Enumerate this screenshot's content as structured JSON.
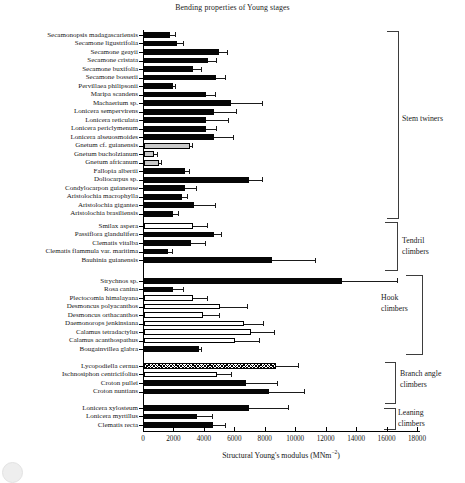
{
  "title": "Bending properties of Young stages",
  "x_axis": {
    "label_main": "Structural Young's modulus (MNm",
    "label_sup": "−2",
    "label_close": ")",
    "ticks": [
      0,
      2000,
      4000,
      6000,
      8000,
      10000,
      12000,
      14000,
      16000,
      18000
    ],
    "min": 0,
    "max": 18000
  },
  "legend_styles": {
    "black": "#060606",
    "gray": "#c9c9c9",
    "white": "#ffffff",
    "hatch": "crosshatch-pattern"
  },
  "chart_data": {
    "type": "bar",
    "orientation": "horizontal",
    "title": "Bending properties of Young stages",
    "xlabel": "Structural Young's modulus (MNm-2)",
    "xlim": [
      0,
      18000
    ],
    "grid": false,
    "error_bars": "upper-only",
    "groups": [
      {
        "label": "Stem twiners",
        "bars": [
          {
            "name": "Secamonopsis madagascariensis",
            "value": 1700,
            "error_high": 2100,
            "style": "black"
          },
          {
            "name": "Secamone ligustrifolia",
            "value": 2200,
            "error_high": 2600,
            "style": "black"
          },
          {
            "name": "Secamone geayii",
            "value": 4900,
            "error_high": 5500,
            "style": "black"
          },
          {
            "name": "Secamone cristata",
            "value": 4200,
            "error_high": 4800,
            "style": "black"
          },
          {
            "name": "Secamone buxifolia",
            "value": 3200,
            "error_high": 3800,
            "style": "black"
          },
          {
            "name": "Secamone bosserii",
            "value": 4700,
            "error_high": 5400,
            "style": "black"
          },
          {
            "name": "Pervillaea philipsonii",
            "value": 1900,
            "error_high": 2100,
            "style": "black"
          },
          {
            "name": "Maripa scandens",
            "value": 4100,
            "error_high": 4700,
            "style": "black"
          },
          {
            "name": "Machaerium sp.",
            "value": 5700,
            "error_high": 7800,
            "style": "black"
          },
          {
            "name": "Lonicera sempervirens",
            "value": 4600,
            "error_high": 6100,
            "style": "black"
          },
          {
            "name": "Lonicera reticulata",
            "value": 4100,
            "error_high": 5600,
            "style": "black"
          },
          {
            "name": "Lonicera periclymenum",
            "value": 4100,
            "error_high": 4800,
            "style": "black"
          },
          {
            "name": "Lonicera alseuosmoides",
            "value": 4600,
            "error_high": 5900,
            "style": "black"
          },
          {
            "name": "Gnetum cf. guianensis",
            "value": 3000,
            "error_high": 3200,
            "style": "gray"
          },
          {
            "name": "Gnetum bucholzianum",
            "value": 650,
            "error_high": 900,
            "style": "gray"
          },
          {
            "name": "Gnetum africanum",
            "value": 1000,
            "error_high": 1200,
            "style": "gray"
          },
          {
            "name": "Fallopia albertii",
            "value": 2700,
            "error_high": 3000,
            "style": "black"
          },
          {
            "name": "Doliocarpus sp.",
            "value": 6900,
            "error_high": 7800,
            "style": "black"
          },
          {
            "name": "Condylocarpon guianense",
            "value": 2700,
            "error_high": 3500,
            "style": "black"
          },
          {
            "name": "Aristolochia macrophylla",
            "value": 2500,
            "error_high": 2900,
            "style": "black"
          },
          {
            "name": "Aristolochia gigantea",
            "value": 3300,
            "error_high": 4700,
            "style": "black"
          },
          {
            "name": "Aristolochia brasiliensis",
            "value": 1900,
            "error_high": 2300,
            "style": "black"
          }
        ]
      },
      {
        "label": "Tendril climbers",
        "bars": [
          {
            "name": "Smilax aspera",
            "value": 3200,
            "error_high": 4200,
            "style": "white"
          },
          {
            "name": "Passiflora glandulifera",
            "value": 4600,
            "error_high": 5100,
            "style": "black"
          },
          {
            "name": "Clematis vitalba",
            "value": 3100,
            "error_high": 4100,
            "style": "black"
          },
          {
            "name": "Clematis flammula var. maritima",
            "value": 1600,
            "error_high": 1900,
            "style": "black"
          },
          {
            "name": "Bauhinia guianensis",
            "value": 8400,
            "error_high": 11300,
            "style": "black"
          }
        ]
      },
      {
        "label": "Hook climbers",
        "bars": [
          {
            "name": "Strychnos sp.",
            "value": 13000,
            "error_high": 16700,
            "style": "black"
          },
          {
            "name": "Rosa canina",
            "value": 1900,
            "error_high": 2600,
            "style": "black"
          },
          {
            "name": "Plectocomia himalayana",
            "value": 3200,
            "error_high": 4200,
            "style": "white"
          },
          {
            "name": "Desmoncus polyacanthos",
            "value": 5000,
            "error_high": 6800,
            "style": "white"
          },
          {
            "name": "Desmoncus orthacanthos",
            "value": 3900,
            "error_high": 5000,
            "style": "white"
          },
          {
            "name": "Daemonorops jenkinsiana",
            "value": 6600,
            "error_high": 7900,
            "style": "white"
          },
          {
            "name": "Calamus tetradactylus",
            "value": 7000,
            "error_high": 8600,
            "style": "white"
          },
          {
            "name": "Calamus acanthospathus",
            "value": 6000,
            "error_high": 7600,
            "style": "white"
          },
          {
            "name": "Bougainvillea glabra",
            "value": 3600,
            "error_high": 3800,
            "style": "black"
          }
        ]
      },
      {
        "label": "Branch angle climbers",
        "bars": [
          {
            "name": "Lycopodiella cernua",
            "value": 8700,
            "error_high": 10200,
            "style": "hatch"
          },
          {
            "name": "Ischnosiphon centricifolius",
            "value": 4800,
            "error_high": 5800,
            "style": "white"
          },
          {
            "name": "Croton pullei",
            "value": 6700,
            "error_high": 8800,
            "style": "black"
          },
          {
            "name": "Croton nuntians",
            "value": 8200,
            "error_high": 10600,
            "style": "black"
          }
        ]
      },
      {
        "label": "Leaning climbers",
        "bars": [
          {
            "name": "Lonicera xylosteum",
            "value": 6900,
            "error_high": 9500,
            "style": "black"
          },
          {
            "name": "Lonicera myrtillus",
            "value": 3500,
            "error_high": 4500,
            "style": "black"
          },
          {
            "name": "Clematis recta",
            "value": 4500,
            "error_high": 5400,
            "style": "black"
          }
        ]
      }
    ]
  }
}
